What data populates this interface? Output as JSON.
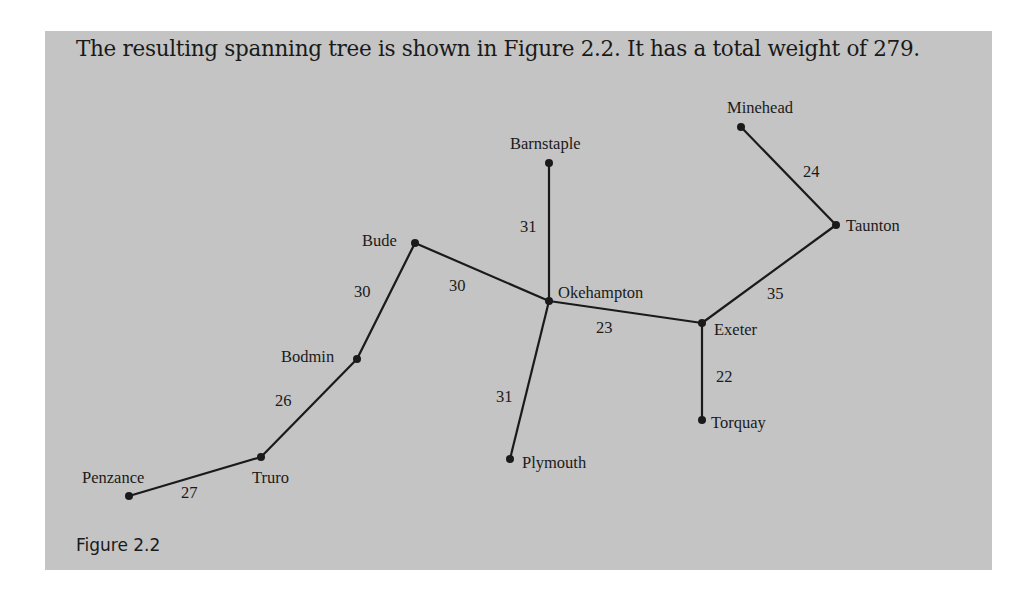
{
  "caption": "The resulting spanning tree is shown in Figure 2.2. It has a total weight of 279.",
  "figure_label": "Figure 2.2",
  "total_weight": 279,
  "colors": {
    "panel": "#c4c4c4",
    "ink": "#1a1a1a",
    "page": "#ffffff"
  },
  "nodes": [
    {
      "id": "minehead",
      "label": "Minehead",
      "x": 741,
      "y": 127,
      "lx": 727,
      "ly": 113,
      "anchor": "start"
    },
    {
      "id": "barnstaple",
      "label": "Barnstaple",
      "x": 549,
      "y": 163,
      "lx": 510,
      "ly": 149,
      "anchor": "start"
    },
    {
      "id": "taunton",
      "label": "Taunton",
      "x": 836,
      "y": 225,
      "lx": 846,
      "ly": 231,
      "anchor": "start"
    },
    {
      "id": "bude",
      "label": "Bude",
      "x": 415,
      "y": 243,
      "lx": 362,
      "ly": 246,
      "anchor": "start"
    },
    {
      "id": "okehampton",
      "label": "Okehampton",
      "x": 549,
      "y": 301,
      "lx": 558,
      "ly": 298,
      "anchor": "start"
    },
    {
      "id": "exeter",
      "label": "Exeter",
      "x": 702,
      "y": 323,
      "lx": 714,
      "ly": 335,
      "anchor": "start"
    },
    {
      "id": "bodmin",
      "label": "Bodmin",
      "x": 357,
      "y": 359,
      "lx": 281,
      "ly": 362,
      "anchor": "start"
    },
    {
      "id": "torquay",
      "label": "Torquay",
      "x": 702,
      "y": 420,
      "lx": 711,
      "ly": 428,
      "anchor": "start"
    },
    {
      "id": "truro",
      "label": "Truro",
      "x": 261,
      "y": 457,
      "lx": 252,
      "ly": 483,
      "anchor": "start"
    },
    {
      "id": "plymouth",
      "label": "Plymouth",
      "x": 510,
      "y": 459,
      "lx": 522,
      "ly": 468,
      "anchor": "start"
    },
    {
      "id": "penzance",
      "label": "Penzance",
      "x": 129,
      "y": 496,
      "lx": 82,
      "ly": 483,
      "anchor": "start"
    }
  ],
  "edges": [
    {
      "from": "minehead",
      "to": "taunton",
      "weight": "24",
      "lx": 803,
      "ly": 177
    },
    {
      "from": "barnstaple",
      "to": "okehampton",
      "weight": "31",
      "lx": 520,
      "ly": 232
    },
    {
      "from": "bude",
      "to": "okehampton",
      "weight": "30",
      "lx": 449,
      "ly": 291
    },
    {
      "from": "bude",
      "to": "bodmin",
      "weight": "30",
      "lx": 354,
      "ly": 297
    },
    {
      "from": "okehampton",
      "to": "exeter",
      "weight": "23",
      "lx": 596,
      "ly": 333
    },
    {
      "from": "taunton",
      "to": "exeter",
      "weight": "35",
      "lx": 767,
      "ly": 299
    },
    {
      "from": "exeter",
      "to": "torquay",
      "weight": "22",
      "lx": 716,
      "ly": 382
    },
    {
      "from": "okehampton",
      "to": "plymouth",
      "weight": "31",
      "lx": 496,
      "ly": 402
    },
    {
      "from": "bodmin",
      "to": "truro",
      "weight": "26",
      "lx": 275,
      "ly": 406
    },
    {
      "from": "truro",
      "to": "penzance",
      "weight": "27",
      "lx": 181,
      "ly": 498
    }
  ]
}
